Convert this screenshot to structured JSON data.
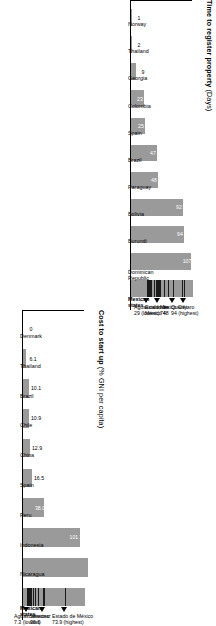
{
  "chart_data": [
    {
      "id": "time-to-register-property",
      "type": "bar",
      "title": "Time to register property",
      "unit": "(Days)",
      "ylabel": "Days",
      "xlabel": "",
      "ylim": [
        0,
        110
      ],
      "grid": false,
      "legend": "none",
      "categories": [
        "Norway",
        "Thailand",
        "Georgia",
        "Colombia",
        "Spain",
        "Brazil",
        "Paraguay",
        "Bolivia",
        "Burundi",
        "Dominican Republic",
        "Mexican states"
      ],
      "values": [
        1,
        2,
        9,
        23,
        25,
        47,
        48,
        92,
        94,
        107,
        null
      ],
      "value_labels": [
        "1",
        "2",
        "9",
        "23",
        "25",
        "47",
        "48",
        "92",
        "94",
        "107",
        ""
      ],
      "range_series": {
        "name": "Mexican states",
        "min": 29,
        "max": 94,
        "ticks": [
          29,
          30,
          31,
          33,
          36,
          40,
          44,
          46,
          47,
          48,
          49,
          52,
          58,
          66,
          74,
          90,
          94
        ],
        "annotations": [
          {
            "label": "Aguascalientes",
            "value": "29 (lowest)",
            "at": 29
          },
          {
            "label": "Estado de",
            "label2": "México 48",
            "value": "",
            "at": 48
          },
          {
            "label": "Mexico City",
            "label2": "74",
            "value": "",
            "at": 74
          },
          {
            "label": "Querétaro",
            "label2": "94 (highest)",
            "value": "",
            "at": 94
          }
        ]
      }
    },
    {
      "id": "cost-to-start-up",
      "type": "bar",
      "title": "Cost to start up",
      "unit": "(% GNI per capita)",
      "ylabel": "% GNI per capita",
      "xlabel": "",
      "ylim": [
        0,
        110
      ],
      "grid": false,
      "legend": "none",
      "categories": [
        "Denmark",
        "Thailand",
        "Brazil",
        "Chile",
        "China",
        "Spain",
        "Peru",
        "Indonesia",
        "Nicaragua",
        "Mexican states"
      ],
      "values": [
        0,
        6.1,
        10.1,
        10.9,
        12.9,
        16.5,
        38.0,
        101.7,
        116,
        null
      ],
      "value_labels": [
        "0",
        "6.1",
        "10.1",
        "10.9",
        "12.9",
        "16.5",
        "38.0",
        "101.7",
        "",
        ""
      ],
      "range_series": {
        "name": "Mexican states",
        "min": 7.3,
        "max": 73.9,
        "ticks": [
          7.3,
          8.0,
          8.6,
          9.2,
          10.0,
          11.0,
          12.5,
          14.0,
          17.0,
          21.0,
          26.0,
          35.6,
          37.0,
          73.9
        ],
        "annotations": [
          {
            "label": "Aguascalientes",
            "label2": "7.3 (lowest)",
            "value": "",
            "at": 7.3
          },
          {
            "label": "Veracruz",
            "label2": "35.6",
            "value": "",
            "at": 35.6
          },
          {
            "label": "Estado de México",
            "label2": "73.9 (highest)",
            "value": "",
            "at": 73.9
          }
        ]
      }
    }
  ],
  "charts": {
    "time": {
      "title": "Time to register property",
      "unit": "(Days)",
      "cats": [
        "Norway",
        "Thailand",
        "Georgia",
        "Colombia",
        "Spain",
        "Brazil",
        "Paraguay",
        "Bolivia",
        "Burundi",
        "Dominican Republic",
        "Mexican states"
      ],
      "vals": [
        "1",
        "2",
        "9",
        "23",
        "25",
        "47",
        "48",
        "92",
        "94",
        "107",
        ""
      ],
      "anno_low_l1": "Aguascalientes",
      "anno_low_l2": "29 (lowest)",
      "anno_mid1_l1": "Estado de",
      "anno_mid1_l2": "México 48",
      "anno_mid2_l1": "Mexico City",
      "anno_mid2_l2": "74",
      "anno_high_l1": "Querétaro",
      "anno_high_l2": "94 (highest)"
    },
    "cost": {
      "title": "Cost to start up",
      "unit": "(% GNI per capita)",
      "cats": [
        "Denmark",
        "Thailand",
        "Brazil",
        "Chile",
        "China",
        "Spain",
        "Peru",
        "Indonesia",
        "Nicaragua",
        "Mexican states"
      ],
      "vals": [
        "0",
        "6.1",
        "10.1",
        "10.9",
        "12.9",
        "16.5",
        "38.0",
        "101.7",
        "",
        ""
      ],
      "anno_low_l1": "Aguascalientes",
      "anno_low_l2": "7.3 (lowest)",
      "anno_mid_l1": "Veracruz",
      "anno_mid_l2": "35.6",
      "anno_high_l1": "Estado de México",
      "anno_high_l2": "73.9 (highest)"
    }
  },
  "colors": {
    "bar": "#9a9a9a",
    "tick": "#1a1a1a",
    "axis": "#000000",
    "value_text": "#ffffff",
    "background": "#ffffff"
  }
}
